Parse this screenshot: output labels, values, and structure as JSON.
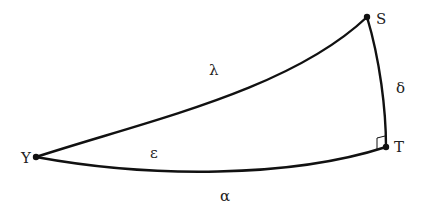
{
  "diagram": {
    "type": "spherical right triangle",
    "colors": {
      "stroke": "#111111",
      "text": "#222222",
      "background": "#ffffff"
    },
    "vertices": [
      {
        "id": "upsilon",
        "label": "Υ",
        "x": 36,
        "y": 157
      },
      {
        "id": "S",
        "label": "S",
        "x": 367,
        "y": 17
      },
      {
        "id": "T",
        "label": "T",
        "x": 386,
        "y": 147
      }
    ],
    "sides": [
      {
        "id": "lambda",
        "label": "λ",
        "from": "upsilon",
        "to": "S"
      },
      {
        "id": "delta",
        "label": "δ",
        "from": "S",
        "to": "T"
      },
      {
        "id": "alpha",
        "label": "α",
        "from": "upsilon",
        "to": "T"
      }
    ],
    "angles": [
      {
        "id": "epsilon",
        "label": "ε",
        "at": "upsilon"
      },
      {
        "id": "right-angle",
        "label": "",
        "at": "T"
      }
    ],
    "labels": {
      "upsilon": "Υ",
      "S": "S",
      "T": "T",
      "lambda": "λ",
      "delta": "δ",
      "alpha": "α",
      "epsilon": "ε"
    }
  }
}
